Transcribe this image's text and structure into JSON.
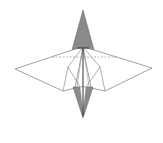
{
  "diagram": {
    "type": "origami-fold-diagram",
    "colors": {
      "background": "#ffffff",
      "line": "#7a7a7a",
      "dark_line": "#333333",
      "shaded": "#8a8a8a",
      "dashed": "#9a9a9a"
    },
    "elements": {
      "top_point": "top-shaded-flap",
      "bottom_point": "bottom-shaded-flap",
      "left_wing": "left-wing",
      "right_wing": "right-wing",
      "valley_fold": "dashed-valley-fold-line",
      "center_crease": "center-vertical-crease"
    }
  }
}
